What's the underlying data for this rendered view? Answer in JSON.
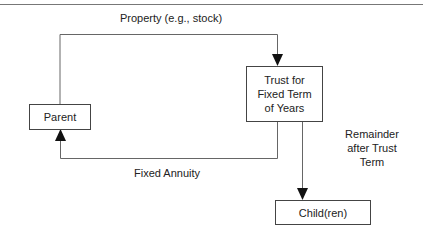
{
  "diagram": {
    "nodes": {
      "parent": {
        "label": "Parent"
      },
      "trust": {
        "label_lines": [
          "Trust for",
          "Fixed Term",
          "of Years"
        ]
      },
      "child": {
        "label": "Child(ren)"
      }
    },
    "edges": {
      "property": {
        "label": "Property (e.g., stock)",
        "from": "parent",
        "to": "trust"
      },
      "annuity": {
        "label": "Fixed Annuity",
        "from": "trust",
        "to": "parent"
      },
      "remainder": {
        "label_lines": [
          "Remainder",
          "after Trust",
          "Term"
        ],
        "from": "trust",
        "to": "child"
      }
    },
    "colors": {
      "line": "#555555",
      "arrow": "#111111",
      "text": "#222222"
    }
  }
}
